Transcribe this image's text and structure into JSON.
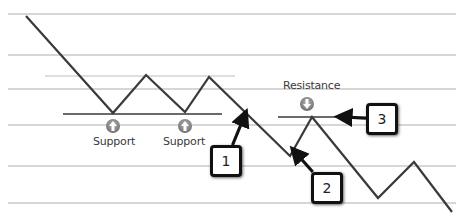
{
  "diagram": {
    "title": "",
    "gridlines_y": [
      14,
      55,
      89,
      125,
      166,
      203
    ],
    "price_path": [
      [
        26,
        16
      ],
      [
        113,
        113
      ],
      [
        146,
        75
      ],
      [
        185,
        112
      ],
      [
        209,
        77
      ],
      [
        290,
        156
      ],
      [
        312,
        117
      ],
      [
        378,
        198
      ],
      [
        414,
        162
      ],
      [
        452,
        212
      ]
    ],
    "short_level_line": {
      "x1": 45,
      "x2": 235,
      "y": 76
    },
    "support_line": {
      "x1": 63,
      "x2": 222,
      "y": 114
    },
    "resistance_line": {
      "x1": 278,
      "x2": 340,
      "y": 117
    },
    "colors": {
      "price_line": "#3a3a3a",
      "grid": "#c9c9c9",
      "level_line": "#6a6a6a",
      "icon": "#8a8a8a"
    },
    "labels": {
      "support_1": "Support",
      "support_2": "Support",
      "resistance": "Resistance"
    },
    "support_icons": [
      {
        "x": 113,
        "y": 126,
        "icon": "up-arrow-icon"
      },
      {
        "x": 185,
        "y": 126,
        "icon": "up-arrow-icon"
      }
    ],
    "resistance_icon": {
      "x": 307,
      "y": 104,
      "icon": "down-arrow-icon"
    },
    "callouts": [
      {
        "number": "1",
        "box": [
          210,
          145
        ],
        "arrow_to": [
          244,
          117
        ]
      },
      {
        "number": "2",
        "box": [
          311,
          172
        ],
        "arrow_to": [
          296,
          153
        ]
      },
      {
        "number": "3",
        "box": [
          366,
          103
        ],
        "arrow_to": [
          343,
          117
        ]
      }
    ]
  }
}
